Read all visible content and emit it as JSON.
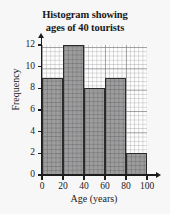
{
  "chart_data": {
    "type": "bar",
    "title": "Histogram showing ages of 40 tourists",
    "title_line1": "Histogram showing",
    "title_line2": "ages of 40 tourists",
    "xlabel": "Age (years)",
    "ylabel": "Frequency",
    "categories": [
      "0-20",
      "20-40",
      "40-60",
      "60-80",
      "80-100"
    ],
    "bin_edges": [
      0,
      20,
      40,
      60,
      80,
      100
    ],
    "values": [
      9,
      12,
      8,
      9,
      2
    ],
    "xlim": [
      0,
      100
    ],
    "ylim": [
      0,
      12
    ],
    "xticks": [
      0,
      20,
      40,
      60,
      80,
      100
    ],
    "yticks": [
      0,
      2,
      4,
      6,
      8,
      10,
      12
    ],
    "xtick_labels": [
      "0",
      "20",
      "40",
      "60",
      "80",
      "100"
    ],
    "ytick_labels": [
      "0",
      "2",
      "4",
      "6",
      "8",
      "10",
      "12"
    ],
    "grid": true,
    "grid_style": "graph-paper-minor-and-major",
    "legend": false,
    "bar_fill_color": "#969696",
    "bar_edge_color": "#2b2b2b",
    "axis_color": "#1d1d1d",
    "background_color": "#f7f7f7",
    "total_frequency": 40
  }
}
